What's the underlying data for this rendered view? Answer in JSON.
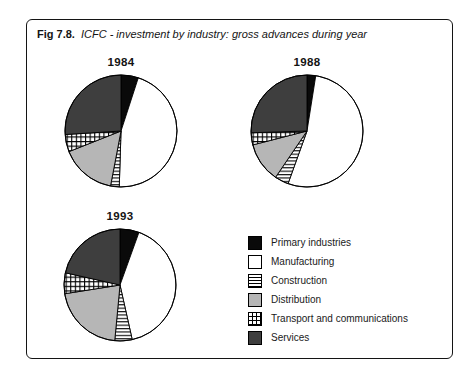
{
  "figure": {
    "label": "Fig 7.8.",
    "title": "ICFC - investment by industry: gross advances during year"
  },
  "colors": {
    "black": "#0a0a0a",
    "dark_gray": "#3e3e3e",
    "light_gray": "#b6b6b6",
    "stroke": "#000000",
    "background": "#ffffff"
  },
  "legend": {
    "position": "bottom-right",
    "items": [
      {
        "label": "Primary industries",
        "pattern": "solid-black"
      },
      {
        "label": "Manufacturing",
        "pattern": "white"
      },
      {
        "label": "Construction",
        "pattern": "horizontal-stripes"
      },
      {
        "label": "Distribution",
        "pattern": "solid-lightgray"
      },
      {
        "label": "Transport and communications",
        "pattern": "grid"
      },
      {
        "label": "Services",
        "pattern": "solid-darkgray"
      }
    ]
  },
  "chart_data": [
    {
      "type": "pie",
      "title": "1984",
      "unit": "% of gross advances (estimated from slice angles)",
      "start_angle_deg": 0,
      "direction": "clockwise",
      "categories": [
        "Primary industries",
        "Manufacturing",
        "Construction",
        "Distribution",
        "Transport and communications",
        "Services"
      ],
      "values": [
        5,
        45.5,
        2.5,
        16,
        5,
        26
      ]
    },
    {
      "type": "pie",
      "title": "1988",
      "unit": "% of gross advances (estimated from slice angles)",
      "start_angle_deg": 0,
      "direction": "clockwise",
      "categories": [
        "Primary industries",
        "Manufacturing",
        "Construction",
        "Distribution",
        "Transport and communications",
        "Services"
      ],
      "values": [
        2.5,
        53,
        4,
        11.5,
        3.5,
        25.5
      ]
    },
    {
      "type": "pie",
      "title": "1993",
      "unit": "% of gross advances (estimated from slice angles)",
      "start_angle_deg": 0,
      "direction": "clockwise",
      "categories": [
        "Primary industries",
        "Manufacturing",
        "Construction",
        "Distribution",
        "Transport and communications",
        "Services"
      ],
      "values": [
        5.5,
        41,
        5,
        21,
        6,
        21.5
      ]
    }
  ]
}
